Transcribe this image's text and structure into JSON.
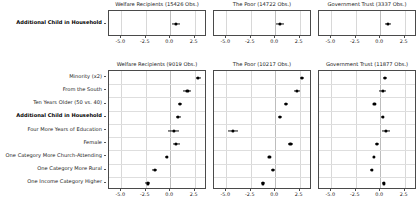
{
  "figure": {
    "type": "coefficient-forest-plot",
    "background": "#ffffff",
    "point_color": "#000000",
    "grid_color": "#d8d8d8"
  },
  "axis": {
    "ticks": [
      -5.0,
      -2.5,
      0.0,
      2.5
    ],
    "tick_labels": [
      "-5.0",
      "-2.5",
      "0.0",
      "2.5"
    ],
    "xlim": [
      -6.25,
      3.75
    ],
    "zero_reference": 0.0
  },
  "panels_top": [
    {
      "title": "Welfare Recipients (15426 Obs.)",
      "outcome": "Welfare Recipients",
      "obs": 15426
    },
    {
      "title": "The Poor (14722 Obs.)",
      "outcome": "The Poor",
      "obs": 14722
    },
    {
      "title": "Government Trust (3337 Obs.)",
      "outcome": "Government Trust",
      "obs": 3337
    }
  ],
  "panels_bottom": [
    {
      "title": "Welfare Recipients (9019 Obs.)",
      "outcome": "Welfare Recipients",
      "obs": 9019
    },
    {
      "title": "The Poor (10217 Obs.)",
      "outcome": "The Poor",
      "obs": 10217
    },
    {
      "title": "Government Trust (11877 Obs.)",
      "outcome": "Government Trust",
      "obs": 11877
    }
  ],
  "top_rows": [
    {
      "label": "Additional Child in Household",
      "bold": true
    }
  ],
  "bottom_rows": [
    {
      "label": "Minority (x2)",
      "bold": false
    },
    {
      "label": "From the South",
      "bold": false
    },
    {
      "label": "Ten Years Older (50 vs. 40)",
      "bold": false
    },
    {
      "label": "Additional Child in Household",
      "bold": true
    },
    {
      "label": "Four More Years of Education",
      "bold": false
    },
    {
      "label": "Female",
      "bold": false
    },
    {
      "label": "One Category More Church-Attending",
      "bold": false
    },
    {
      "label": "One Category More Rural",
      "bold": false
    },
    {
      "label": "One Income Category Higher",
      "bold": false
    }
  ],
  "chart_data": {
    "type": "scatter",
    "subtype": "coefficient plot with confidence intervals",
    "title": "",
    "xlabel": "",
    "ylabel": "",
    "xlim": [
      -6.25,
      3.75
    ],
    "xticks": [
      -5.0,
      -2.5,
      0.0,
      2.5
    ],
    "grid": true,
    "legend": "none",
    "blocks": [
      {
        "block": "top",
        "categories": [
          "Additional Child in Household"
        ],
        "series": [
          {
            "name": "Welfare Recipients (15426 Obs.)",
            "estimates": [
              0.55
            ],
            "ci_low": [
              0.15
            ],
            "ci_high": [
              0.95
            ]
          },
          {
            "name": "The Poor (14722 Obs.)",
            "estimates": [
              0.5
            ],
            "ci_low": [
              0.1
            ],
            "ci_high": [
              0.9
            ]
          },
          {
            "name": "Government Trust (3337 Obs.)",
            "estimates": [
              0.75
            ],
            "ci_low": [
              0.45
            ],
            "ci_high": [
              1.05
            ]
          }
        ]
      },
      {
        "block": "bottom",
        "categories": [
          "Minority (x2)",
          "From the South",
          "Ten Years Older (50 vs. 40)",
          "Additional Child in Household",
          "Four More Years of Education",
          "Female",
          "One Category More Church-Attending",
          "One Category More Rural",
          "One Income Category Higher"
        ],
        "series": [
          {
            "name": "Welfare Recipients (9019 Obs.)",
            "estimates": [
              2.85,
              1.75,
              0.95,
              0.8,
              0.35,
              0.6,
              -0.35,
              -1.6,
              -2.3
            ],
            "ci_low": [
              2.6,
              1.35,
              0.75,
              0.55,
              -0.2,
              0.25,
              -0.5,
              -1.85,
              -2.55
            ],
            "ci_high": [
              3.1,
              2.15,
              1.15,
              1.05,
              0.9,
              0.95,
              -0.2,
              -1.35,
              -2.05
            ]
          },
          {
            "name": "The Poor (10217 Obs.)",
            "estimates": [
              2.75,
              2.25,
              1.1,
              0.45,
              -4.3,
              1.55,
              -0.6,
              -0.25,
              -1.25
            ],
            "ci_low": [
              2.55,
              1.95,
              0.9,
              0.25,
              -4.85,
              1.3,
              -0.75,
              -0.45,
              -1.45
            ],
            "ci_high": [
              2.95,
              2.55,
              1.3,
              0.65,
              -3.75,
              1.8,
              -0.45,
              -0.05,
              -1.05
            ]
          },
          {
            "name": "Government Trust (11877 Obs.)",
            "estimates": [
              0.45,
              0.25,
              -0.6,
              0.25,
              0.55,
              -0.35,
              -0.65,
              -0.85,
              0.35
            ],
            "ci_low": [
              0.25,
              -0.1,
              -0.7,
              0.1,
              0.15,
              -0.55,
              -0.75,
              -1.0,
              0.2
            ],
            "ci_high": [
              0.65,
              0.6,
              -0.5,
              0.4,
              0.95,
              -0.15,
              -0.55,
              -0.7,
              0.5
            ]
          }
        ]
      }
    ]
  }
}
